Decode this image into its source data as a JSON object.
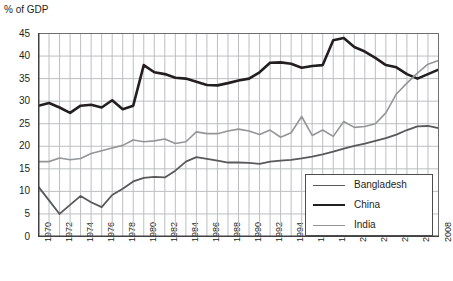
{
  "chart_data": {
    "type": "line",
    "title": "",
    "ylabel": "% of GDP",
    "xlabel": "",
    "ylim": [
      0,
      45
    ],
    "ytick_step": 5,
    "yticks": [
      "0",
      "5",
      "10",
      "15",
      "20",
      "25",
      "30",
      "35",
      "40",
      "45"
    ],
    "xlim": [
      1970,
      2008
    ],
    "xticks": [
      "1970",
      "1972",
      "1974",
      "1976",
      "1978",
      "1980",
      "1982",
      "1984",
      "1986",
      "1988",
      "1990",
      "1992",
      "1994",
      "1996",
      "1998",
      "2000",
      "2002",
      "2004",
      "2006",
      "2008"
    ],
    "x": [
      1970,
      1971,
      1972,
      1973,
      1974,
      1975,
      1976,
      1977,
      1978,
      1979,
      1980,
      1981,
      1982,
      1983,
      1984,
      1985,
      1986,
      1987,
      1988,
      1989,
      1990,
      1991,
      1992,
      1993,
      1994,
      1995,
      1996,
      1997,
      1998,
      1999,
      2000,
      2001,
      2002,
      2003,
      2004,
      2005,
      2006,
      2007,
      2008
    ],
    "grid": true,
    "legend_position": "bottom-right",
    "series": [
      {
        "name": "Bangladesh",
        "color": "#58595b",
        "width": 1.8,
        "values": [
          11.0,
          8.0,
          5.0,
          7.0,
          9.0,
          7.6,
          6.5,
          9.2,
          10.6,
          12.2,
          13.0,
          13.2,
          13.1,
          14.6,
          16.6,
          17.6,
          17.2,
          16.8,
          16.4,
          16.4,
          16.3,
          16.1,
          16.6,
          16.8,
          17.0,
          17.3,
          17.7,
          18.2,
          18.8,
          19.5,
          20.1,
          20.6,
          21.2,
          21.8,
          22.6,
          23.6,
          24.4,
          24.5,
          24.0
        ]
      },
      {
        "name": "China",
        "color": "#231f20",
        "width": 2.6,
        "values": [
          29.0,
          29.6,
          28.6,
          27.4,
          29.0,
          29.2,
          28.6,
          30.2,
          28.2,
          29.0,
          38.0,
          36.4,
          36.0,
          35.2,
          35.0,
          34.3,
          33.6,
          33.5,
          34.0,
          34.6,
          35.0,
          36.4,
          38.5,
          38.6,
          38.3,
          37.4,
          37.8,
          38.0,
          43.5,
          44.0,
          42.0,
          41.0,
          39.6,
          38.0,
          37.5,
          36.0,
          35.0,
          36.0,
          37.0
        ]
      },
      {
        "name": "India",
        "color": "#939598",
        "width": 1.6,
        "values": [
          16.6,
          16.6,
          17.4,
          17.0,
          17.3,
          18.4,
          19.0,
          19.6,
          20.2,
          21.4,
          21.0,
          21.2,
          21.6,
          20.6,
          21.0,
          23.2,
          22.8,
          22.8,
          23.4,
          23.8,
          23.4,
          22.6,
          23.6,
          22.0,
          23.0,
          26.6,
          22.4,
          23.6,
          22.2,
          25.5,
          24.2,
          24.4,
          25.0,
          27.4,
          31.6,
          34.0,
          36.2,
          38.2,
          39.0
        ]
      }
    ]
  },
  "legend": {
    "items": [
      {
        "label": "Bangladesh"
      },
      {
        "label": "China"
      },
      {
        "label": "India"
      }
    ]
  }
}
